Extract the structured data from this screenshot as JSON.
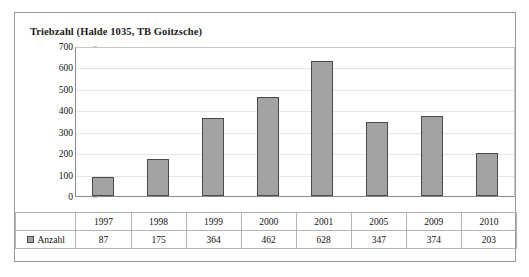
{
  "chart_data": {
    "type": "bar",
    "title": "Triebzahl (Halde 1035, TB Goitzsche)",
    "xlabel": "",
    "ylabel": "",
    "ylim": [
      0,
      700
    ],
    "y_ticks": [
      0,
      100,
      200,
      300,
      400,
      500,
      600,
      700
    ],
    "grid": true,
    "legend_position": "table-row-left",
    "categories": [
      "1997",
      "1998",
      "1999",
      "2000",
      "2001",
      "2005",
      "2009",
      "2010"
    ],
    "series": [
      {
        "name": "Anzahl",
        "values": [
          87,
          175,
          364,
          462,
          628,
          347,
          374,
          203
        ],
        "color": "#a3a3a3",
        "border_color": "#4a4a4a"
      }
    ]
  },
  "table": {
    "legend_label": "Anzahl",
    "row_values": [
      "87",
      "175",
      "364",
      "462",
      "628",
      "347",
      "374",
      "203"
    ]
  },
  "colors": {
    "bar_fill": "#a3a3a3",
    "bar_border": "#4a4a4a",
    "frame": "#9a9a9a",
    "gridline": "#e6e6e6",
    "axis": "#8c8c8c",
    "text": "#111111",
    "background": "#ffffff"
  }
}
